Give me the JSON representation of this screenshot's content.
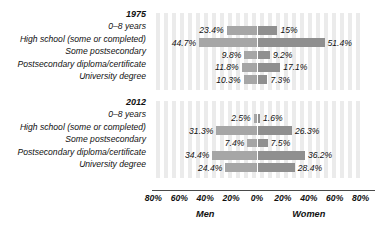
{
  "chart_data": {
    "type": "bar",
    "title": "",
    "subtitle": "",
    "orientation": "horizontal-diverging",
    "xlabel": "",
    "ylabel": "",
    "xlim": [
      -80,
      80
    ],
    "grid": false,
    "legend_position": "below-axis",
    "axis_ticks": [
      "80%",
      "60%",
      "40%",
      "20%",
      "0%",
      "20%",
      "40%",
      "60%",
      "80%"
    ],
    "axis_tick_values": [
      -80,
      -60,
      -40,
      -20,
      0,
      20,
      40,
      60,
      80
    ],
    "axis_groups": [
      {
        "name": "Men",
        "side": "left"
      },
      {
        "name": "Women",
        "side": "right"
      }
    ],
    "categories": [
      "0–8 years",
      "High school (some or completed)",
      "Some postsecondary",
      "Postsecondary diploma/certificate",
      "University degree"
    ],
    "panels": [
      {
        "title": "1975",
        "series": [
          {
            "name": "Men",
            "values": [
              23.4,
              44.7,
              9.8,
              11.8,
              10.3
            ],
            "labels": [
              "23.4%",
              "44.7%",
              "9.8%",
              "11.8%",
              "10.3%"
            ]
          },
          {
            "name": "Women",
            "values": [
              15.0,
              51.4,
              9.2,
              17.1,
              7.3
            ],
            "labels": [
              "15%",
              "51.4%",
              "9.2%",
              "17.1%",
              "7.3%"
            ]
          }
        ]
      },
      {
        "title": "2012",
        "series": [
          {
            "name": "Men",
            "values": [
              2.5,
              31.3,
              7.4,
              34.4,
              24.4
            ],
            "labels": [
              "2.5%",
              "31.3%",
              "7.4%",
              "34.4%",
              "24.4%"
            ]
          },
          {
            "name": "Women",
            "values": [
              1.6,
              26.3,
              7.5,
              36.2,
              28.4
            ],
            "labels": [
              "1.6%",
              "26.3%",
              "7.5%",
              "36.2%",
              "28.4%"
            ]
          }
        ]
      }
    ],
    "colors": {
      "men_bar": "#a6a6a6",
      "women_bar": "#8f8f8f",
      "panel_stripe": "#ebebeb",
      "panel_background": "#ffffff",
      "axis": "#4a4a4a",
      "text": "#111111"
    }
  }
}
